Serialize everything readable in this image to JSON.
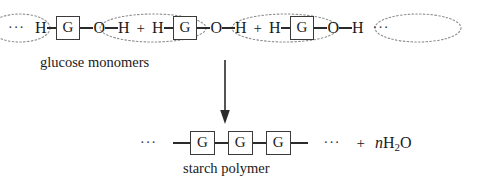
{
  "figure": {
    "type": "chemical-reaction-diagram",
    "reaction": "condensation polymerization of glucose to starch",
    "background_color": "#ffffff",
    "ink_color": "#1a1a1a",
    "highlight_color": "#8a8a8a"
  },
  "reactants": {
    "caption": "glucose monomers",
    "leading_ellipsis": "···",
    "trailing_ellipsis": "···",
    "plus": "+",
    "units": [
      {
        "left_h": "H",
        "core": "G",
        "o": "O",
        "right_h": "H"
      },
      {
        "left_h": "H",
        "core": "G",
        "o": "O",
        "right_h": "H"
      },
      {
        "left_h": "H",
        "core": "G",
        "o": "O",
        "right_h": "H"
      }
    ]
  },
  "arrow": {
    "direction": "down",
    "label": ""
  },
  "products": {
    "caption": "starch polymer",
    "leading_ellipsis": "···",
    "trailing_ellipsis": "···",
    "plus": "+",
    "chain": [
      "G",
      "G",
      "G"
    ],
    "water": {
      "coefficient": "n",
      "element_h": "H",
      "subscript": "2",
      "element_o": "O"
    }
  },
  "annotations": {
    "eliminated_groups_note": "dotted ellipses enclose the H and O—H groups removed as water"
  }
}
